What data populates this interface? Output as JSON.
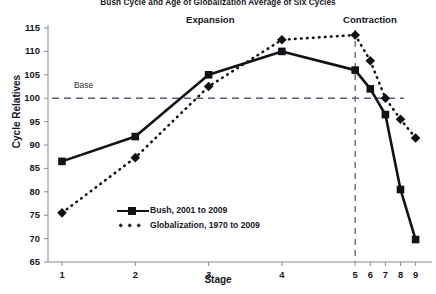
{
  "chart_data": {
    "type": "line",
    "title": "Bush Cycle and Age of Globalization Average of Six Cycles",
    "xlabel": "Stage",
    "ylabel": "Cycle Relatives",
    "x": [
      1,
      2,
      3,
      4,
      5,
      6,
      7,
      8,
      9
    ],
    "xtick_labels": [
      "1",
      "2",
      "3",
      "4",
      "5",
      "6",
      "7",
      "8",
      "9"
    ],
    "ytick_labels": [
      "65",
      "70",
      "75",
      "80",
      "85",
      "90",
      "95",
      "100",
      "105",
      "110",
      "115"
    ],
    "ylim": [
      65,
      115
    ],
    "ytick_step": 5,
    "grid": false,
    "legend_position": "lower-left-inside",
    "series": [
      {
        "name": "Bush, 2001 to 2009",
        "style": "solid",
        "marker": "square",
        "color": "#111118",
        "values": [
          86.5,
          91.8,
          105.0,
          110.0,
          106.0,
          102.0,
          96.5,
          80.5,
          69.8
        ]
      },
      {
        "name": "Globalization, 1970 to 2009",
        "style": "dotted",
        "marker": "diamond",
        "color": "#111118",
        "values": [
          75.5,
          87.3,
          102.5,
          112.5,
          113.5,
          108.0,
          100.0,
          95.5,
          91.5
        ]
      }
    ],
    "annotations": [
      {
        "name": "base-line",
        "label": "Base",
        "type": "horizontal-line",
        "value": 100,
        "style": "dashed",
        "color": "#5a5f8a"
      },
      {
        "name": "phase-divider",
        "label": "",
        "type": "vertical-line",
        "value": 5,
        "style": "dashed",
        "color": "#6b6b75"
      },
      {
        "name": "expansion-label",
        "label": "Expansion",
        "type": "text"
      },
      {
        "name": "contraction-label",
        "label": "Contraction",
        "type": "text"
      }
    ]
  },
  "axis_color": "#8a8a92",
  "text_color": "#16161e"
}
